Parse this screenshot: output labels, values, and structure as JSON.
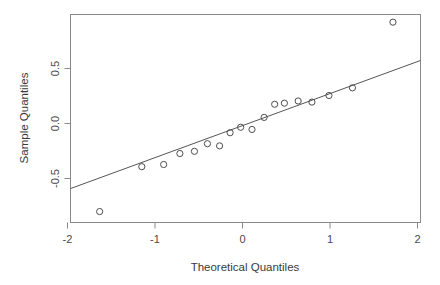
{
  "chart_data": {
    "type": "scatter",
    "title": "",
    "subtitle": "",
    "xlabel": "Theoretical Quantiles",
    "ylabel": "Sample Quantiles",
    "xlim": [
      -2.15,
      2.17
    ],
    "ylim": [
      -0.92,
      0.98
    ],
    "xticks": [
      -2,
      -1,
      0,
      1,
      2
    ],
    "xtick_labels": [
      "-2",
      "-1",
      "0",
      "1",
      "2"
    ],
    "yticks": [
      -0.5,
      0.0,
      0.5
    ],
    "ytick_labels": [
      "-0.5",
      "0.0",
      "0.5"
    ],
    "grid": false,
    "legend": null,
    "marker": "open-circle",
    "marker_color": "#4d4d4d",
    "line_color": "#555555",
    "frame_color": "#8a8a8a",
    "background": "#ffffff",
    "x": [
      -1.79,
      -1.27,
      -1.0,
      -0.8,
      -0.62,
      -0.46,
      -0.31,
      -0.18,
      -0.05,
      0.09,
      0.24,
      0.37,
      0.49,
      0.66,
      0.83,
      1.04,
      1.33,
      1.83
    ],
    "y": [
      -0.82,
      -0.41,
      -0.39,
      -0.29,
      -0.27,
      -0.2,
      -0.22,
      -0.1,
      -0.05,
      -0.07,
      0.04,
      0.16,
      0.17,
      0.19,
      0.18,
      0.24,
      0.31,
      0.91
    ],
    "points": [
      {
        "x": -1.79,
        "y": -0.82
      },
      {
        "x": -1.27,
        "y": -0.41
      },
      {
        "x": -1.0,
        "y": -0.39
      },
      {
        "x": -0.8,
        "y": -0.29
      },
      {
        "x": -0.62,
        "y": -0.27
      },
      {
        "x": -0.46,
        "y": -0.2
      },
      {
        "x": -0.31,
        "y": -0.22
      },
      {
        "x": -0.18,
        "y": -0.1
      },
      {
        "x": -0.05,
        "y": -0.05
      },
      {
        "x": 0.09,
        "y": -0.07
      },
      {
        "x": 0.24,
        "y": 0.04
      },
      {
        "x": 0.37,
        "y": 0.16
      },
      {
        "x": 0.49,
        "y": 0.17
      },
      {
        "x": 0.66,
        "y": 0.19
      },
      {
        "x": 0.83,
        "y": 0.18
      },
      {
        "x": 1.04,
        "y": 0.24
      },
      {
        "x": 1.33,
        "y": 0.31
      },
      {
        "x": 1.83,
        "y": 0.91
      }
    ],
    "reference_line": {
      "x1": -2.15,
      "y1": -0.61,
      "x2": 2.17,
      "y2": 0.56,
      "description": "qqline through first and third quartiles"
    }
  }
}
